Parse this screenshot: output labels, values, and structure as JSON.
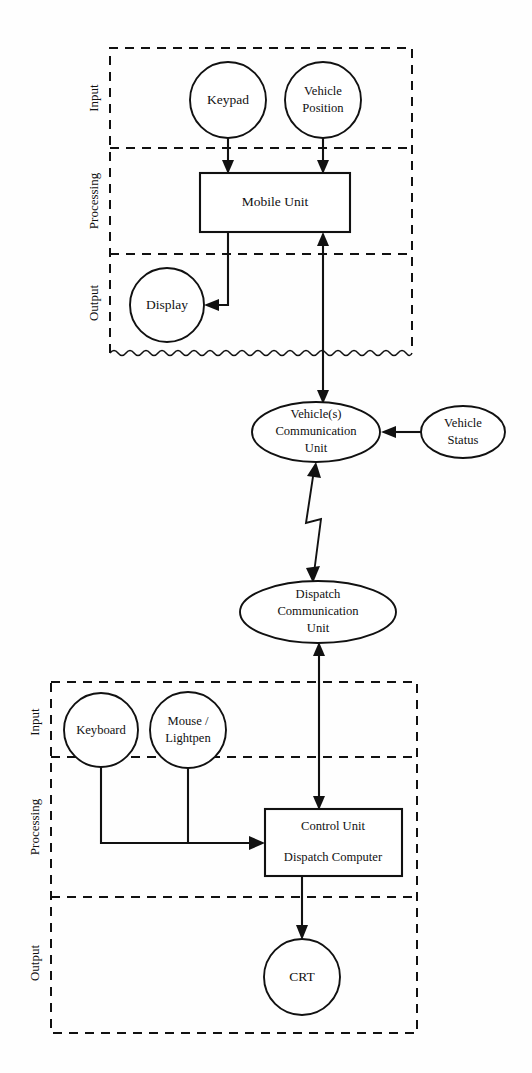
{
  "diagram": {
    "type": "block-diagram",
    "background_color": "#fefefe",
    "line_color": "#111111",
    "subsystems": [
      {
        "id": "mobile",
        "name": "Mobile Subsystem",
        "zones": [
          "Input",
          "Processing",
          "Output"
        ],
        "bottom_edge_style": "wavy"
      },
      {
        "id": "dispatch",
        "name": "Dispatch Subsystem",
        "zones": [
          "Input",
          "Processing",
          "Output"
        ],
        "bottom_edge_style": "dashed"
      }
    ],
    "zone_labels": {
      "input": "Input",
      "processing": "Processing",
      "output": "Output"
    },
    "nodes": {
      "keypad": {
        "label": "Keypad",
        "shape": "circle"
      },
      "vehicle_position": {
        "label_line1": "Vehicle",
        "label_line2": "Position",
        "shape": "circle"
      },
      "mobile_unit": {
        "label": "Mobile Unit",
        "shape": "rectangle"
      },
      "display": {
        "label": "Display",
        "shape": "circle"
      },
      "vehicle_comm_unit": {
        "label_line1": "Vehicle(s)",
        "label_line2": "Communication",
        "label_line3": "Unit",
        "shape": "ellipse"
      },
      "vehicle_status": {
        "label_line1": "Vehicle",
        "label_line2": "Status",
        "shape": "ellipse"
      },
      "dispatch_comm_unit": {
        "label_line1": "Dispatch",
        "label_line2": "Communication",
        "label_line3": "Unit",
        "shape": "ellipse"
      },
      "keyboard": {
        "label": "Keyboard",
        "shape": "circle"
      },
      "mouse_lightpen": {
        "label_line1": "Mouse /",
        "label_line2": "Lightpen",
        "shape": "circle"
      },
      "control_unit": {
        "label_line1": "Control Unit",
        "label_line2": "Dispatch Computer",
        "shape": "rectangle"
      },
      "crt": {
        "label": "CRT",
        "shape": "circle"
      }
    },
    "links": [
      {
        "from": "keypad",
        "to": "mobile_unit",
        "style": "straight-arrow"
      },
      {
        "from": "vehicle_position",
        "to": "mobile_unit",
        "style": "straight-arrow"
      },
      {
        "from": "mobile_unit",
        "to": "display",
        "style": "elbow-arrow"
      },
      {
        "from": "mobile_unit",
        "to": "vehicle_comm_unit",
        "style": "double-arrow"
      },
      {
        "from": "vehicle_status",
        "to": "vehicle_comm_unit",
        "style": "straight-arrow"
      },
      {
        "from": "vehicle_comm_unit",
        "to": "dispatch_comm_unit",
        "style": "lightning-double-arrow"
      },
      {
        "from": "dispatch_comm_unit",
        "to": "control_unit",
        "style": "double-arrow"
      },
      {
        "from": "keyboard",
        "to": "control_unit",
        "style": "elbow-arrow"
      },
      {
        "from": "mouse_lightpen",
        "to": "control_unit",
        "style": "elbow-arrow"
      },
      {
        "from": "control_unit",
        "to": "crt",
        "style": "straight-arrow"
      }
    ]
  }
}
